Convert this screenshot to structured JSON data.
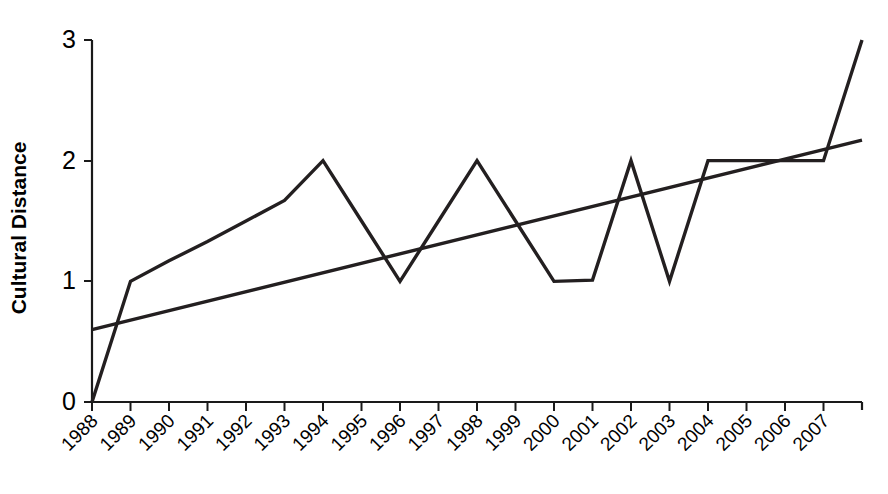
{
  "chart_data": {
    "type": "line",
    "title": "",
    "xlabel": "",
    "ylabel": "Cultural Distance",
    "ylim": [
      0,
      3
    ],
    "yticks": [
      0,
      1,
      2,
      3
    ],
    "ytick_labels": [
      "0",
      "1",
      "2",
      "3"
    ],
    "grid": false,
    "legend": null,
    "categories": [
      "1988",
      "1989",
      "1990",
      "1991",
      "1992",
      "1993",
      "1994",
      "1995",
      "1996",
      "1997",
      "1998",
      "1999",
      "2000",
      "2001",
      "2002",
      "2003",
      "2004",
      "2005",
      "2006",
      "2007"
    ],
    "xtick_labels": [
      "1988",
      "1989",
      "1990",
      "1991",
      "1992",
      "1993",
      "1994",
      "1995",
      "1996",
      "1997",
      "1998",
      "1999",
      "2000",
      "2001",
      "2002",
      "2003",
      "2004",
      "2005",
      "2006",
      "2007"
    ],
    "series": [
      {
        "name": "Cultural Distance",
        "x": [
          1988,
          1989,
          1990,
          1991,
          1992,
          1993,
          1994,
          1995,
          1996,
          1997,
          1998,
          1999,
          2000,
          2001,
          2002,
          2003,
          2004,
          2005,
          2006,
          2007,
          2008
        ],
        "values": [
          0,
          1,
          1.17,
          1.33,
          1.5,
          1.67,
          2,
          1.5,
          1,
          1.5,
          2,
          1.5,
          1,
          1.01,
          2,
          1,
          2,
          2,
          2,
          2,
          3
        ]
      },
      {
        "name": "Linear trend",
        "x": [
          1988,
          2008
        ],
        "values": [
          0.6,
          2.17
        ]
      }
    ]
  },
  "axis": {
    "y_title": "Cultural Distance"
  },
  "colors": {
    "background": "#ffffff",
    "line": "#231f20",
    "axis": "#1a1a1a",
    "text": "#000000"
  }
}
